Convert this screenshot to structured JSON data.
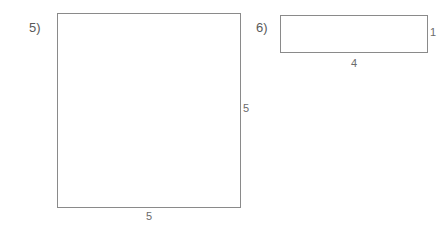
{
  "worksheet": {
    "background_color": "#ffffff",
    "stroke_color": "#8a8a8a",
    "text_color": "#5a5a5a"
  },
  "problems": [
    {
      "number_label": "5)",
      "shape": "square",
      "width_label": "5",
      "height_label": "5"
    },
    {
      "number_label": "6)",
      "shape": "rectangle",
      "width_label": "4",
      "height_label": "1"
    }
  ]
}
